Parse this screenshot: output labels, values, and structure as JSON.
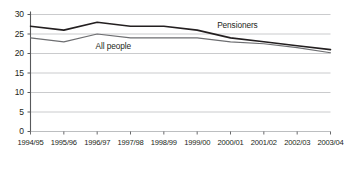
{
  "chart_data": {
    "type": "line",
    "title": "",
    "subtitle": "",
    "xlabel": "",
    "ylabel": "",
    "grid": true,
    "legend_position": "inline-annotation",
    "xlim": [
      0,
      9
    ],
    "ylim": [
      0,
      30
    ],
    "yticks": [
      0,
      5,
      10,
      15,
      20,
      25,
      30
    ],
    "ytick_labels": [
      "0",
      "5",
      "10",
      "15",
      "20",
      "25",
      "30"
    ],
    "categories": [
      "1994/95",
      "1995/96",
      "1996/97",
      "1997/98",
      "1998/99",
      "1999/00",
      "2000/01",
      "2001/02",
      "2002/03",
      "2003/04"
    ],
    "series": [
      {
        "name": "Pensioners",
        "color": "#231f20",
        "values": [
          27,
          26,
          28,
          27,
          27,
          26,
          24,
          23,
          22,
          21
        ]
      },
      {
        "name": "All people",
        "color": "#6d6e71",
        "values": [
          24,
          23,
          25,
          24,
          24,
          24,
          23,
          22.5,
          21.5,
          20.2
        ]
      }
    ],
    "annotations": [
      {
        "text": "Pensioners",
        "series": "Pensioners",
        "x_index": 5.6,
        "y_value": 27.4
      },
      {
        "text": "All people",
        "series": "All people",
        "x_index": 1.95,
        "y_value": 21.9
      }
    ]
  },
  "axis": {
    "y_axis_color": "#58595b",
    "gridline_color": "#bcbec0",
    "tick_color": "#58595b"
  }
}
